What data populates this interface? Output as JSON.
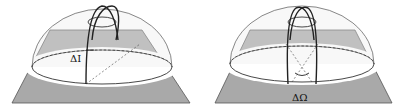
{
  "figure": {
    "panels": [
      {
        "id": "inclination",
        "label": "ΔI",
        "description": "hemisphere with tilted orbital arcs showing inclination change"
      },
      {
        "id": "node",
        "label": "ΔΩ",
        "description": "hemisphere with arcs rotated about vertical axis showing node change"
      }
    ]
  },
  "colors": {
    "plane": "#a9a9a9",
    "ring": "#ffffff",
    "lines": "#222222"
  }
}
